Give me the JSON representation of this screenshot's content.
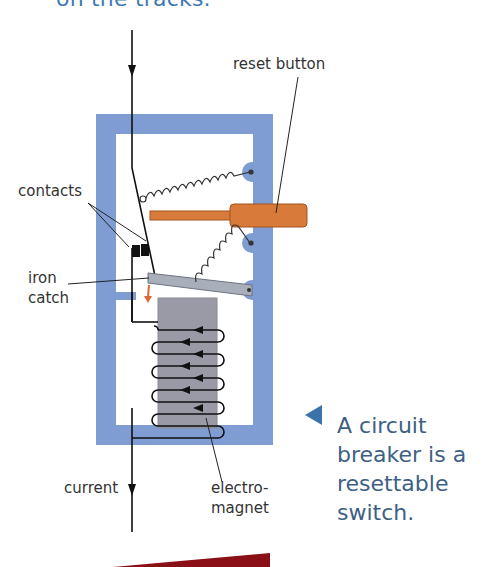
{
  "heading": {
    "text": "on the tracks."
  },
  "diagram": {
    "title": "Circuit breaker",
    "labels": {
      "reset_button": "reset button",
      "contacts": "contacts",
      "iron_catch_line1": "iron",
      "iron_catch_line2": "catch",
      "current": "current",
      "electromagnet_line1": "electro-",
      "electromagnet_line2": "magnet"
    },
    "colors": {
      "frame": "#7f9dd3",
      "reset_button": "#d77a3a",
      "core": "#9a9aa6",
      "catch": "#a9aebb",
      "arrow": "#e0663a",
      "heading": "#3f79b3",
      "caption": "#3e5f85",
      "bottom_band": "#8b0f16"
    }
  },
  "caption": {
    "icon": "triangle-left-icon",
    "text": "A circuit breaker is a resettable switch."
  }
}
